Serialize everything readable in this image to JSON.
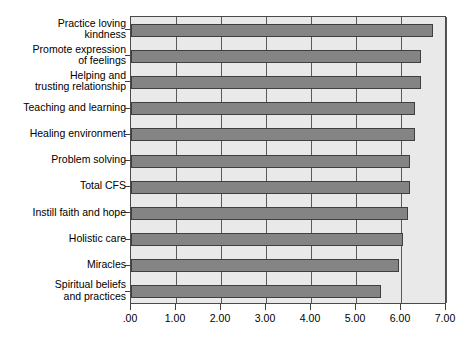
{
  "chart_data": {
    "type": "bar",
    "orientation": "horizontal",
    "title": "",
    "subtitle": "",
    "xlabel": "",
    "ylabel": "",
    "xlim": [
      0,
      7
    ],
    "ylim": null,
    "grid": true,
    "legend": null,
    "legend_position": "none",
    "xtick_labels": [
      ".00",
      "1.00",
      "2.00",
      "3.00",
      "4.00",
      "5.00",
      "6.00",
      "7.00"
    ],
    "xtick_values": [
      0,
      1,
      2,
      3,
      4,
      5,
      6,
      7
    ],
    "categories": [
      "Practice loving\nkindness",
      "Promote expression\nof feelings",
      "Helping and\ntrusting relationship",
      "Teaching and learning",
      "Healing environment",
      "Problem solving",
      "Total CFS",
      "Instill faith and hope",
      "Holistic care",
      "Miracles",
      "Spiritual beliefs\nand practices"
    ],
    "values": [
      6.7,
      6.45,
      6.45,
      6.3,
      6.3,
      6.2,
      6.2,
      6.15,
      6.05,
      5.95,
      5.55
    ],
    "bar_color": "#848484",
    "bar_edge_color": "#3f3f3f",
    "plot_background": "#e9e9e9",
    "axis_color": "#3f3f3f",
    "figure_background": "#ffffff"
  }
}
